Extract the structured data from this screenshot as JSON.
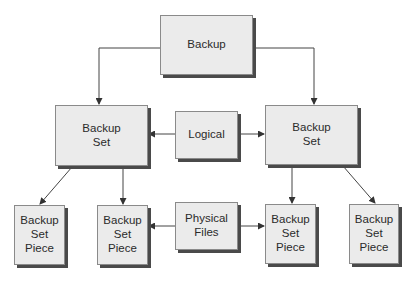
{
  "diagram": {
    "type": "hierarchy",
    "nodes": {
      "backup": {
        "label": "Backup"
      },
      "set_left": {
        "label": "Backup\nSet"
      },
      "logical": {
        "label": "Logical"
      },
      "set_right": {
        "label": "Backup\nSet"
      },
      "piece_1": {
        "label": "Backup\nSet\nPiece"
      },
      "piece_2": {
        "label": "Backup\nSet\nPiece"
      },
      "physical": {
        "label": "Physical\nFiles"
      },
      "piece_3": {
        "label": "Backup\nSet\nPiece"
      },
      "piece_4": {
        "label": "Backup\nSet\nPiece"
      }
    },
    "edges": [
      {
        "from": "backup",
        "to": "set_left"
      },
      {
        "from": "backup",
        "to": "set_right"
      },
      {
        "from": "logical",
        "to": "set_left"
      },
      {
        "from": "logical",
        "to": "set_right"
      },
      {
        "from": "set_left",
        "to": "piece_1"
      },
      {
        "from": "set_left",
        "to": "piece_2"
      },
      {
        "from": "set_right",
        "to": "piece_3"
      },
      {
        "from": "set_right",
        "to": "piece_4"
      },
      {
        "from": "physical",
        "to": "piece_2"
      },
      {
        "from": "physical",
        "to": "piece_3"
      }
    ]
  }
}
